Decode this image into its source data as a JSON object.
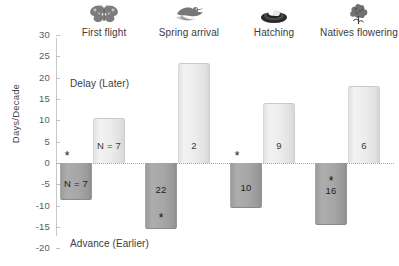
{
  "chart_data": {
    "type": "bar",
    "title": "",
    "xlabel": "",
    "ylabel": "Days/Decade",
    "ylim": [
      -20,
      30
    ],
    "yticks": [
      30,
      25,
      20,
      15,
      10,
      5,
      0,
      -5,
      -10,
      -15,
      -20
    ],
    "ytick_labels": [
      "30",
      "25",
      "20",
      "15",
      "10",
      "5",
      "0",
      "-5",
      "-10",
      "-15",
      "-20"
    ],
    "grid": false,
    "legend": "none",
    "zero_line": true,
    "categories": [
      "First flight",
      "Spring arrival",
      "Hatching",
      "Natives flowering"
    ],
    "series": [
      {
        "name": "Delay (Later)",
        "direction": "positive",
        "color": "#ececec",
        "values": [
          10.5,
          23.5,
          14.0,
          18.0
        ],
        "labels": [
          "N = 7",
          "2",
          "9",
          "6"
        ],
        "significant": [
          false,
          false,
          false,
          false
        ]
      },
      {
        "name": "Advance (Earlier)",
        "direction": "negative",
        "color": "#a6a6a6",
        "values": [
          -8.7,
          -15.5,
          -10.5,
          -14.5
        ],
        "labels": [
          "N = 7",
          "22",
          "10",
          "16"
        ],
        "significant": [
          true,
          true,
          true,
          true
        ]
      }
    ],
    "annotations": [
      {
        "text": "Delay (Later)",
        "value_region": "upper"
      },
      {
        "text": "Advance (Earlier)",
        "value_region": "lower"
      }
    ],
    "icons": [
      "butterfly-icon",
      "bird-icon",
      "nest-egg-icon",
      "flower-icon"
    ],
    "significance_marker": "*"
  },
  "axis": {
    "y_title": "Days/Decade"
  },
  "annotations": {
    "delay": "Delay (Later)",
    "advance": "Advance (Earlier)"
  },
  "groups": [
    {
      "category": "First flight",
      "icon": "butterfly-icon",
      "pos_label": "N = 7",
      "neg_label": "N = 7",
      "pos_star": "",
      "neg_star": "*"
    },
    {
      "category": "Spring arrival",
      "icon": "bird-icon",
      "pos_label": "2",
      "neg_label": "22",
      "pos_star": "",
      "neg_star": "*"
    },
    {
      "category": "Hatching",
      "icon": "nest-egg-icon",
      "pos_label": "9",
      "neg_label": "10",
      "pos_star": "",
      "neg_star": "*"
    },
    {
      "category": "Natives flowering",
      "icon": "flower-icon",
      "pos_label": "6",
      "neg_label": "16",
      "pos_star": "",
      "neg_star": "*"
    }
  ]
}
